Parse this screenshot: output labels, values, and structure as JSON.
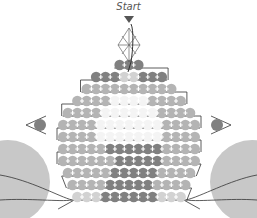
{
  "diagram": {
    "start_label": "Start",
    "colors": {
      "dark_bead": "#808080",
      "medium_bead": "#b4b4b4",
      "light_bead": "#d2d2d2",
      "white_bead": "#f4f4f4",
      "thread": "#333333",
      "large_bead": "#c8c8c8",
      "crystal_outline": "#666666"
    },
    "rows": [
      {
        "y": 65,
        "pattern": "DDD"
      },
      {
        "y": 77,
        "pattern": "DDDLLDDD"
      },
      {
        "y": 89,
        "pattern": "MMMMMMMMMM"
      },
      {
        "y": 101,
        "pattern": "MMMMWWWWMMMM"
      },
      {
        "y": 113,
        "pattern": "MMMMWWWWWWMMMM"
      },
      {
        "y": 125,
        "pattern": "MMMMWWWWWWWMMMM"
      },
      {
        "y": 137,
        "pattern": "MMMMWWWWWWWMMMM"
      },
      {
        "y": 149,
        "pattern": "MMMMMDDDDDDMMMM"
      },
      {
        "y": 161,
        "pattern": "MMMMMMDDDDDMMMM"
      },
      {
        "y": 173,
        "pattern": "MMMMMDDDDDMMMM"
      },
      {
        "y": 185,
        "pattern": "MMMMDDDDDMMMM"
      },
      {
        "y": 197,
        "pattern": "LLLDDDDDDLLL"
      }
    ],
    "end_beads": {
      "left_x": 40,
      "right_x": 217,
      "y": 125
    },
    "large_beads": [
      {
        "cx": 8,
        "cy": 182,
        "r": 42
      },
      {
        "cx": 252,
        "cy": 182,
        "r": 42
      }
    ]
  }
}
